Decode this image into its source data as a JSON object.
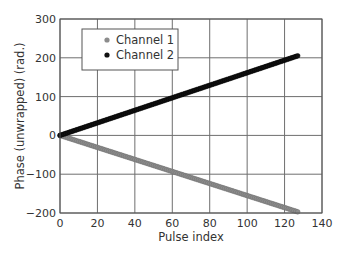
{
  "chart_data": {
    "type": "scatter",
    "title": "",
    "xlabel": "Pulse index",
    "ylabel": "Phase (unwrapped) (rad.)",
    "xlim": [
      0,
      140
    ],
    "ylim": [
      -200,
      300
    ],
    "xticks": [
      0,
      20,
      40,
      60,
      80,
      100,
      120,
      140
    ],
    "yticks": [
      -200,
      -100,
      0,
      100,
      200,
      300
    ],
    "grid": true,
    "legend_position": "upper left",
    "series": [
      {
        "name": "Channel 1",
        "color": "#8c8c8c",
        "x_range": [
          0,
          127
        ],
        "y_start": 0,
        "y_end": -197,
        "slope": -1.55,
        "points": 128
      },
      {
        "name": "Channel 2",
        "color": "#111111",
        "x_range": [
          0,
          127
        ],
        "y_start": 0,
        "y_end": 205,
        "slope": 1.61,
        "points": 128
      }
    ]
  },
  "legend": {
    "items": [
      {
        "label": "Channel 1",
        "color": "#8c8c8c"
      },
      {
        "label": "Channel 2",
        "color": "#111111"
      }
    ]
  },
  "axes": {
    "xlabel": "Pulse index",
    "ylabel": "Phase (unwrapped) (rad.)"
  }
}
